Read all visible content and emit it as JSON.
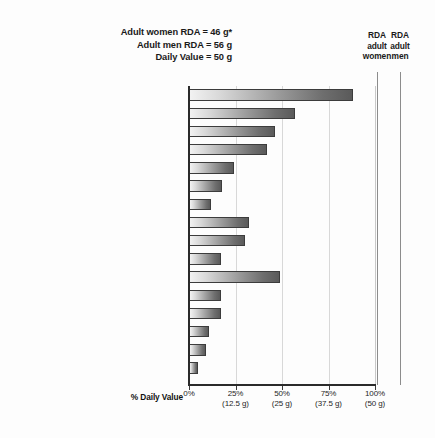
{
  "title": {
    "line1": "Adult women RDA = 46 g*",
    "line2": "Adult men RDA = 56 g",
    "line3": "Daily Value = 50 g"
  },
  "reference_headers": {
    "women": [
      "RDA",
      "adult",
      "women"
    ],
    "men": [
      "RDA",
      "adult",
      "men"
    ]
  },
  "axis": {
    "x_title": "% Daily Value",
    "ticks": [
      {
        "pct": "0%",
        "grams": ""
      },
      {
        "pct": "25%",
        "grams": "(12.5 g)"
      },
      {
        "pct": "50%",
        "grams": "(25 g)"
      },
      {
        "pct": "75%",
        "grams": "(37.5 g)"
      },
      {
        "pct": "100%",
        "grams": "(50 g)"
      }
    ]
  },
  "chart_data": {
    "type": "bar",
    "orientation": "horizontal",
    "xlabel": "% Daily Value",
    "ylabel": "",
    "xlim": [
      0,
      100
    ],
    "grid": true,
    "legend": "none",
    "categories": [
      "Tofu, 1 cup",
      "Chicken breast, 3 oz",
      "Tuna, 3 oz",
      "Legumes, 1 cup",
      "Almonds, 2 oz",
      "Peanut butter, 2 tbsp",
      "Egg, 1 large",
      "Cheddar cheese, 2 oz",
      "Yogurt, plain, 1 cup",
      "Milk, 1 cup",
      "Edamame (green soybeans), 1 cup",
      "Pasta, 1 cup",
      "All-bran® cereal, 1 cup",
      "Brown rice, 1 cup",
      "White rice, 1 cup",
      "Bread, 2 slices"
    ],
    "values": [
      88,
      57,
      46,
      42,
      24,
      18,
      12,
      32,
      30,
      17,
      49,
      17,
      17,
      11,
      9,
      5
    ],
    "annotations": [
      {
        "label": "RDA adult women",
        "value": 92,
        "note": "46 g of 50 g Daily Value"
      },
      {
        "label": "RDA adult men",
        "value": 112,
        "note": "56 g of 50 g Daily Value"
      }
    ],
    "notes": [
      "Adult women RDA = 46 g*",
      "Adult men RDA = 56 g",
      "Daily Value = 50 g"
    ]
  },
  "colors": {
    "bar_light": "#f2f2f2",
    "bar_dark": "#5a5a5a",
    "bar_outline": "#3c3c3c",
    "axis": "#2b2b2b",
    "gridline": "#d8d8d8",
    "reference_line": "#8c8c8c",
    "text": "#1f1f1f",
    "background": "#fdfdfd"
  }
}
